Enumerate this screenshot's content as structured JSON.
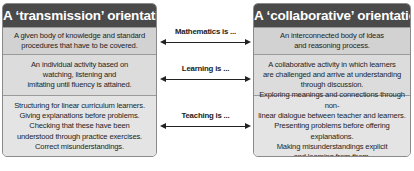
{
  "left": {
    "title": "A ‘transmission’ orientation",
    "rows": [
      "A given body of knowledge and standard\nprocedures that have  to be covered.",
      "An individual activity based on\nwatching, listening and\nimitating until fluency is attained.",
      "Structuring for linear curriculum learners.\nGiving explanations before problems.\nChecking that these have been\nunderstood through practice exercises.\nCorrect misunderstandings."
    ]
  },
  "right": {
    "title": "A ‘collaborative’ orientation",
    "rows": [
      "An interconnected body of ideas\nand reasoning process.",
      "A collaborative activity in which learners\nare challenged and arrive at understanding\nthrough discussion.",
      "Exploring meanings and connections through non-\nlinear dialogue between teacher and learners.\nPresenting problems before offering explanations.\nMaking misunderstandings explicit\nand learning from them."
    ]
  },
  "connectors": [
    {
      "label": "Mathematics is ..."
    },
    {
      "label": "Learning is ..."
    },
    {
      "label": "Teaching is ..."
    }
  ],
  "colors": {
    "header_bg": "#4a4a4a",
    "panel_bg": "#dcdcdc",
    "arrow": "#222222"
  }
}
